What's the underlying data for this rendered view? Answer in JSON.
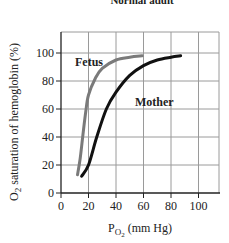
{
  "chart_data": {
    "type": "line",
    "title": "Normal adult",
    "xlabel": "P_O2 (mm Hg)",
    "xlabel_main": "P",
    "xlabel_sub": "O",
    "xlabel_subsub": "2",
    "xlabel_unit": "(mm Hg)",
    "ylabel": "O2 saturation of hemoglobin (%)",
    "ylabel_pre": "O",
    "ylabel_sub": "2",
    "ylabel_post": " saturation of hemoglobin (%)",
    "xlim": [
      0,
      115
    ],
    "ylim": [
      0,
      115
    ],
    "xticks": [
      0,
      20,
      40,
      60,
      80,
      100
    ],
    "yticks": [
      0,
      20,
      40,
      60,
      80,
      100
    ],
    "xtick_labels": [
      "0",
      "20",
      "40",
      "60",
      "80",
      "100"
    ],
    "ytick_labels": [
      "0",
      "20",
      "40",
      "60",
      "80",
      "100"
    ],
    "grid": true,
    "legend": "inline labels",
    "series": [
      {
        "name": "Fetus",
        "color": "#7a7a7a",
        "x": [
          12,
          14,
          16,
          18,
          20,
          25,
          30,
          40,
          50,
          59
        ],
        "y": [
          13,
          25,
          42,
          58,
          70,
          82,
          89,
          95,
          97,
          98
        ]
      },
      {
        "name": "Mother",
        "color": "#111111",
        "x": [
          15,
          20,
          26,
          33,
          40,
          50,
          60,
          70,
          80,
          87
        ],
        "y": [
          12,
          20,
          40,
          60,
          72,
          84,
          91,
          95,
          97,
          98
        ]
      }
    ]
  }
}
